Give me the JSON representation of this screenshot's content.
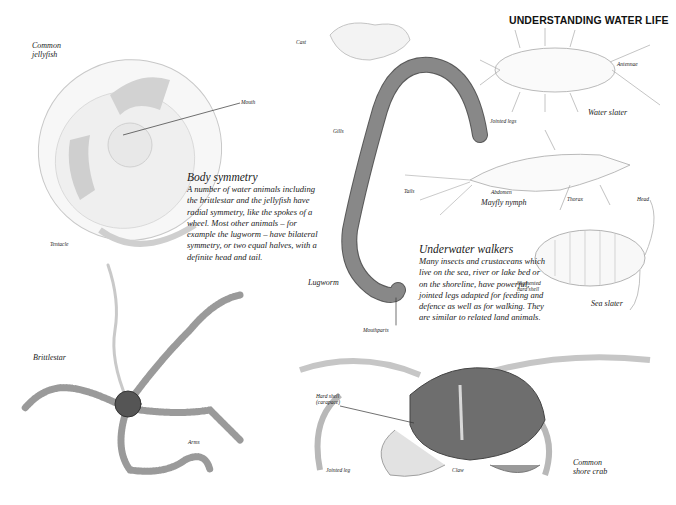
{
  "page": {
    "title": "UNDERSTANDING WATER LIFE"
  },
  "sections": {
    "body_symmetry": {
      "heading": "Body symmetry",
      "text": "A number of water animals including the brittlestar and the jellyfish have radial symmetry, like the spokes of a wheel. Most other animals – for example the lugworm – have bilateral symmetry, or two equal halves, with a definite head and tail."
    },
    "underwater_walkers": {
      "heading": "Underwater walkers",
      "text": "Many insects and crustaceans which live on the sea, river or lake bed or on the shoreline, have powerful, jointed legs adapted for feeding and defence as well as for walking. They are similar to related land animals."
    }
  },
  "illustrations": {
    "jellyfish": {
      "name_line1": "Common",
      "name_line2": "jellyfish",
      "labels": {
        "mouth": "Mouth",
        "tentacle": "Tentacle"
      }
    },
    "brittlestar": {
      "name": "Brittlestar",
      "labels": {
        "arms": "Arms"
      }
    },
    "lugworm": {
      "name": "Lugworm",
      "labels": {
        "cast": "Cast",
        "gills": "Gills",
        "mouthparts": "Mouthparts"
      }
    },
    "water_slater": {
      "name": "Water slater",
      "labels": {
        "antennae": "Antennae",
        "jointed_legs": "Jointed legs"
      }
    },
    "mayfly_nymph": {
      "name": "Mayfly nymph",
      "labels": {
        "tails": "Tails",
        "abdomen": "Abdomen",
        "thorax": "Thorax",
        "head": "Head"
      }
    },
    "sea_slater": {
      "name": "Sea slater",
      "labels": {
        "segmented_line1": "Segmented",
        "segmented_line2": "hard shell"
      }
    },
    "shore_crab": {
      "name_line1": "Common",
      "name_line2": "shore crab",
      "labels": {
        "hard_shell_line1": "Hard shell",
        "hard_shell_line2": "(carapace)",
        "jointed_leg": "Jointed leg",
        "claw": "Claw"
      }
    }
  }
}
